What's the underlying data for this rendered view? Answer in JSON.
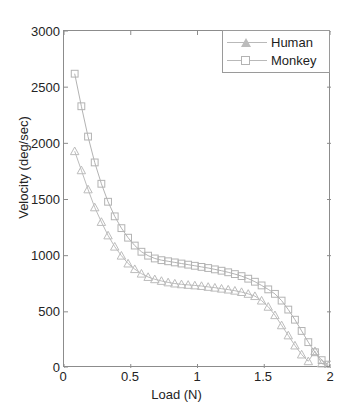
{
  "top_text": "ШЕПЕЛЕВА ЕЕТ ЕЕЕЕ ЕТ ТТ ТТРЕТ ТЕТЕ ТЕТ ЕТЕ ТТ ЕТ ЕЕ ТЕ ЕЕ",
  "legend": {
    "position": "top-right",
    "entries": [
      {
        "label": "Human",
        "marker": "triangle",
        "color": "#bcbcbc"
      },
      {
        "label": "Monkey",
        "marker": "square",
        "color": "#b3b3b3"
      }
    ]
  },
  "axes": {
    "x_label": "Load (N)",
    "y_label": "Velocity (deg/sec)",
    "x_ticks": [
      "0",
      "0.5",
      "1",
      "1.5",
      "2"
    ],
    "y_ticks": [
      "0",
      "500",
      "1000",
      "1500",
      "2000",
      "2500",
      "3000"
    ]
  },
  "chart_data": {
    "type": "line",
    "title": "",
    "xlabel": "Load (N)",
    "ylabel": "Velocity (deg/sec)",
    "xlim": [
      0,
      2
    ],
    "ylim": [
      0,
      3000
    ],
    "xticks": [
      0,
      0.5,
      1,
      1.5,
      2
    ],
    "yticks": [
      0,
      500,
      1000,
      1500,
      2000,
      2500,
      3000
    ],
    "grid": false,
    "legend_position": "upper right",
    "series": [
      {
        "name": "Human",
        "marker": "triangle",
        "color": "#bcbcbc",
        "x": [
          0.08,
          0.13,
          0.18,
          0.23,
          0.28,
          0.33,
          0.38,
          0.43,
          0.48,
          0.53,
          0.58,
          0.63,
          0.68,
          0.73,
          0.78,
          0.83,
          0.88,
          0.93,
          0.98,
          1.03,
          1.08,
          1.13,
          1.18,
          1.23,
          1.28,
          1.33,
          1.38,
          1.43,
          1.48,
          1.53,
          1.58,
          1.63,
          1.68,
          1.73,
          1.78,
          1.83,
          1.88,
          1.93,
          1.98
        ],
        "y": [
          1930,
          1760,
          1590,
          1430,
          1300,
          1180,
          1080,
          1000,
          930,
          880,
          840,
          810,
          790,
          775,
          762,
          752,
          745,
          740,
          735,
          730,
          722,
          715,
          706,
          698,
          688,
          676,
          660,
          640,
          600,
          545,
          470,
          380,
          290,
          200,
          120,
          60,
          150,
          40,
          20
        ]
      },
      {
        "name": "Monkey",
        "marker": "square",
        "color": "#b3b3b3",
        "x": [
          0.08,
          0.13,
          0.18,
          0.23,
          0.28,
          0.33,
          0.38,
          0.43,
          0.48,
          0.53,
          0.58,
          0.63,
          0.68,
          0.73,
          0.78,
          0.83,
          0.88,
          0.93,
          0.98,
          1.03,
          1.08,
          1.13,
          1.18,
          1.23,
          1.28,
          1.33,
          1.38,
          1.43,
          1.48,
          1.53,
          1.58,
          1.63,
          1.68,
          1.73,
          1.78,
          1.83,
          1.88,
          1.93,
          1.98
        ],
        "y": [
          2620,
          2330,
          2060,
          1830,
          1640,
          1480,
          1350,
          1245,
          1160,
          1090,
          1035,
          1000,
          975,
          960,
          950,
          940,
          930,
          920,
          910,
          900,
          890,
          878,
          866,
          852,
          836,
          818,
          795,
          768,
          735,
          700,
          660,
          600,
          520,
          430,
          330,
          230,
          140,
          70,
          30
        ]
      }
    ]
  }
}
